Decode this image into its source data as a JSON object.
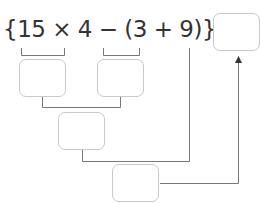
{
  "expression": {
    "text": "{15 × 4 − (3 + 9)} ÷ 8 =",
    "parts": [
      "{15 × 4",
      " − (3 + 9)}",
      " ÷ 8",
      " ="
    ]
  },
  "boxes": [
    {
      "id": "answer",
      "value": ""
    },
    {
      "id": "step-15x4",
      "value": ""
    },
    {
      "id": "step-3plus9",
      "value": ""
    },
    {
      "id": "step-subtract",
      "value": ""
    },
    {
      "id": "step-divide",
      "value": ""
    }
  ],
  "colors": {
    "text": "#333333",
    "box_border": "#c8c8c8",
    "line": "#777777"
  }
}
